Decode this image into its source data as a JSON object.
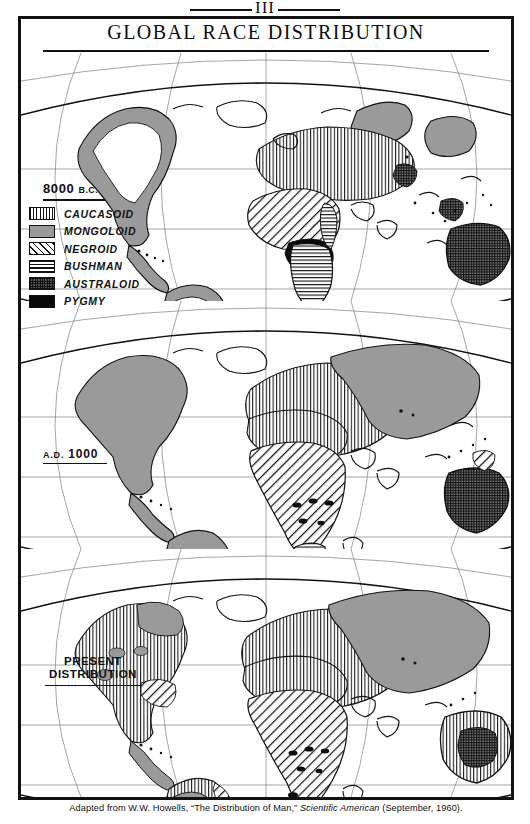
{
  "plate": {
    "number": "III"
  },
  "title": "GLOBAL RACE DISTRIBUTION",
  "legend": {
    "era_title": "8000",
    "era_title_suffix": "B.C.",
    "items": [
      {
        "label": "CAUCASOID",
        "pattern": "vertical-lines",
        "swatch_class": "sw-caucasoid"
      },
      {
        "label": "MONGOLOID",
        "pattern": "solid-gray",
        "swatch_class": "sw-mongoloid"
      },
      {
        "label": "NEGROID",
        "pattern": "diagonal-hatch",
        "swatch_class": "sw-negroid"
      },
      {
        "label": "BUSHMAN",
        "pattern": "horizontal-lines",
        "swatch_class": "sw-bushman"
      },
      {
        "label": "AUSTRALOID",
        "pattern": "dense-crosshatch",
        "swatch_class": "sw-australoid"
      },
      {
        "label": "PYGMY",
        "pattern": "solid-black",
        "swatch_class": "sw-pygmy"
      }
    ]
  },
  "panels": [
    {
      "id": "panel-8000bc",
      "label_main": "8000",
      "label_suffix": "B.C."
    },
    {
      "id": "panel-ad1000",
      "label_main": "A.D.",
      "label_suffix": "1000"
    },
    {
      "id": "panel-present",
      "label_line1": "PRESENT",
      "label_line2": "DISTRIBUTION"
    }
  ],
  "footer": {
    "prefix": "Adapted from W.W. Howells, “The Distribution of Man,” ",
    "journal": "Scientific American",
    "suffix": " (September, 1960)."
  },
  "colors": {
    "ink": "#111111",
    "mongoloid_gray": "#9a9a9a",
    "paper": "#ffffff"
  }
}
